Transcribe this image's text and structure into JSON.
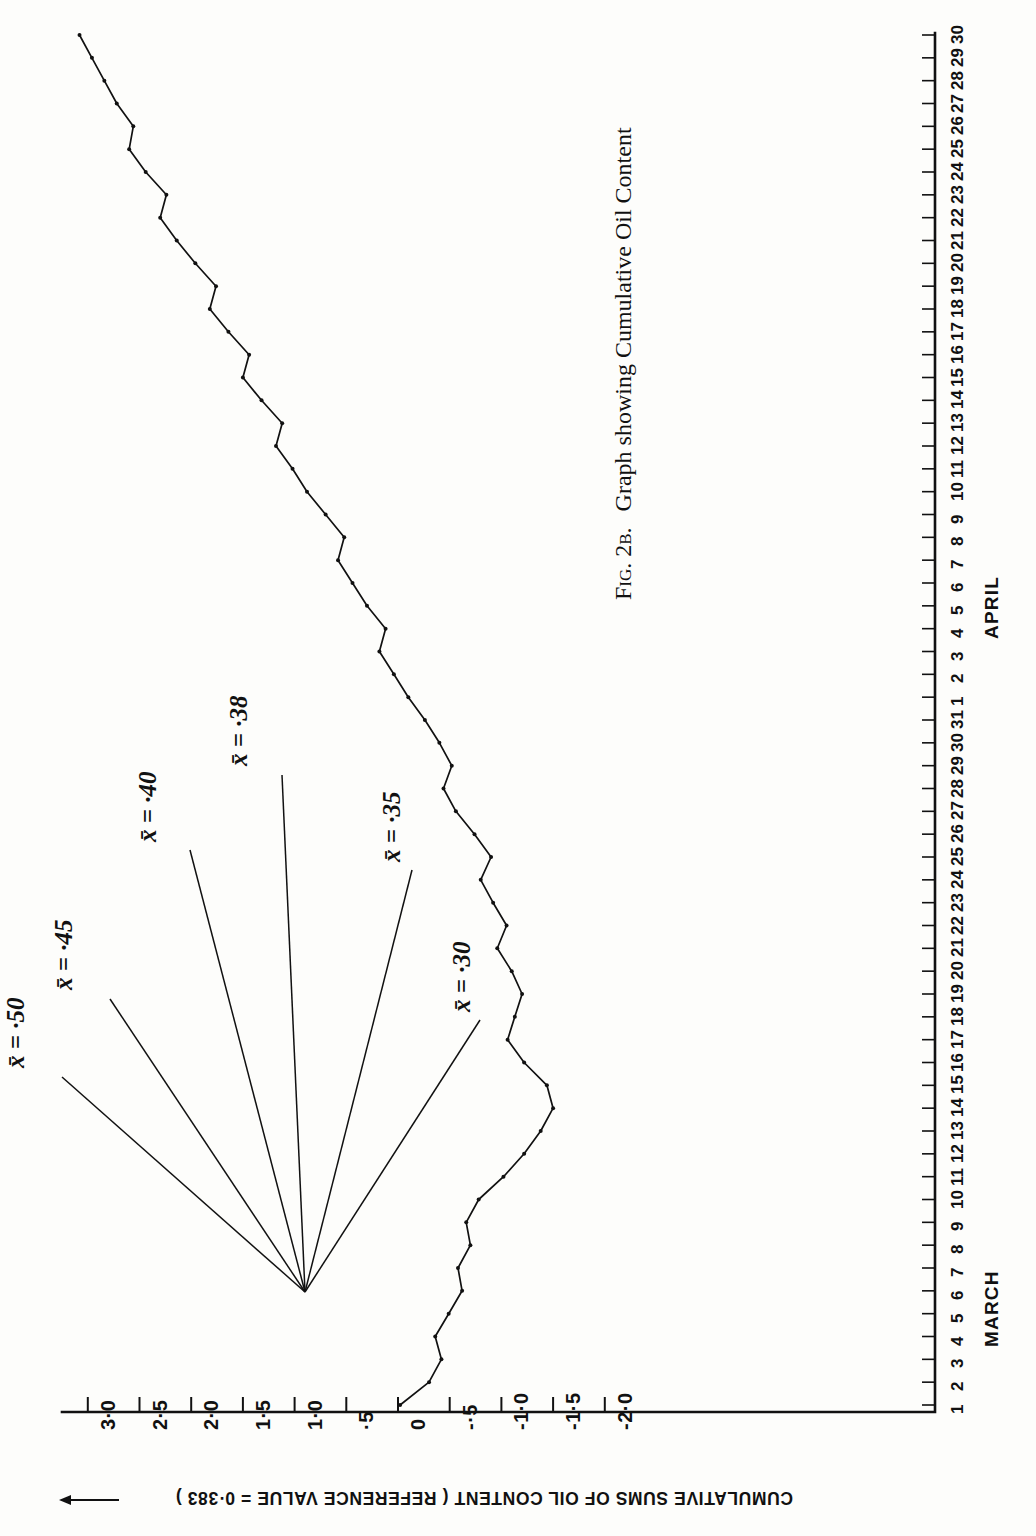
{
  "figure": {
    "caption_prefix": "Fig. 2b.",
    "caption_text": "Graph showing Cumulative Oil Content"
  },
  "chart_data": {
    "type": "line",
    "title": "Graph showing Cumulative Oil Content",
    "orientation": "rotated-90-ccw",
    "xlabel": "",
    "ylabel": "CUMULATIVE SUMS OF OIL CONTENT ( REFERENCE VALUE = 0·383 )",
    "value_axis": {
      "label": "CUMULATIVE SUMS OF OIL CONTENT ( REFERENCE VALUE = 0·383 )",
      "reference_value": 0.383,
      "ticks": [
        "3·0",
        "2·5",
        "2·0",
        "1·5",
        "1·0",
        "·5",
        "0",
        "-·5",
        "-1·0",
        "-1·5",
        "-2·0"
      ],
      "tick_values": [
        3.0,
        2.5,
        2.0,
        1.5,
        1.0,
        0.5,
        0.0,
        -0.5,
        -1.0,
        -1.5,
        -2.0
      ],
      "range": [
        -2.0,
        3.25
      ],
      "arrow_direction": "increasing"
    },
    "date_axis": {
      "months": [
        {
          "name": "MARCH",
          "days": [
            "1",
            "2",
            "3",
            "4",
            "5",
            "6",
            "7",
            "8",
            "9",
            "10",
            "11",
            "12",
            "13",
            "14",
            "15",
            "16",
            "17",
            "18",
            "19",
            "20",
            "21",
            "22",
            "23",
            "24",
            "25",
            "26",
            "27",
            "28",
            "29",
            "30",
            "31"
          ]
        },
        {
          "name": "APRIL",
          "days": [
            "1",
            "2",
            "3",
            "4",
            "5",
            "6",
            "7",
            "8",
            "9",
            "10",
            "11",
            "12",
            "13",
            "14",
            "15",
            "16",
            "17",
            "18",
            "19",
            "20",
            "21",
            "22",
            "23",
            "24",
            "25",
            "26",
            "27",
            "28",
            "29",
            "30"
          ]
        }
      ],
      "total_days": 61
    },
    "grid": false,
    "legend": false,
    "x": [
      1,
      2,
      3,
      4,
      5,
      6,
      7,
      8,
      9,
      10,
      11,
      12,
      13,
      14,
      15,
      16,
      17,
      18,
      19,
      20,
      21,
      22,
      23,
      24,
      25,
      26,
      27,
      28,
      29,
      30,
      31,
      32,
      33,
      34,
      35,
      36,
      37,
      38,
      39,
      40,
      41,
      42,
      43,
      44,
      45,
      46,
      47,
      48,
      49,
      50,
      51,
      52,
      53,
      54,
      55,
      56,
      57,
      58,
      59,
      60,
      61
    ],
    "values": [
      -0.02,
      -0.3,
      -0.42,
      -0.36,
      -0.49,
      -0.62,
      -0.58,
      -0.7,
      -0.66,
      -0.78,
      -1.02,
      -1.22,
      -1.38,
      -1.5,
      -1.44,
      -1.22,
      -1.06,
      -1.13,
      -1.2,
      -1.1,
      -0.96,
      -1.05,
      -0.92,
      -0.8,
      -0.9,
      -0.74,
      -0.56,
      -0.44,
      -0.52,
      -0.4,
      -0.26,
      -0.1,
      0.04,
      0.18,
      0.12,
      0.3,
      0.44,
      0.58,
      0.52,
      0.7,
      0.88,
      1.02,
      1.18,
      1.12,
      1.32,
      1.5,
      1.44,
      1.64,
      1.82,
      1.76,
      1.96,
      2.14,
      2.3,
      2.24,
      2.44,
      2.6,
      2.56,
      2.72,
      2.84,
      2.96,
      3.08
    ],
    "annotations": [
      {
        "label": "x̄ = ·50",
        "value": 0.5
      },
      {
        "label": "x̄ = ·45",
        "value": 0.45
      },
      {
        "label": "x̄ = ·40",
        "value": 0.4
      },
      {
        "label": "x̄ = ·38",
        "value": 0.38
      },
      {
        "label": "x̄ = ·35",
        "value": 0.35
      },
      {
        "label": "x̄ = ·30",
        "value": 0.3
      }
    ]
  }
}
